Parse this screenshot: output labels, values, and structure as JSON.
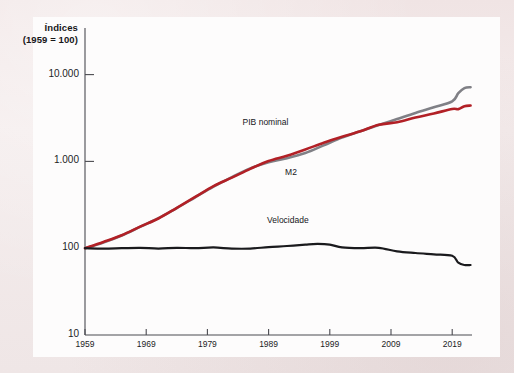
{
  "figure": {
    "background_color": "#f0e6e6",
    "panel_color": "#fdfcfc",
    "axis_color": "#4a4a50"
  },
  "chart_data": {
    "type": "line",
    "title": "",
    "subtitle": "",
    "axis_title_line1": "Índices",
    "axis_title_line2": "(1959 = 100)",
    "xlabel": "",
    "ylabel": "Índices (1959 = 100)",
    "yscale": "log",
    "ylim": [
      10,
      20000
    ],
    "xlim": [
      1959,
      2023
    ],
    "grid": false,
    "legend_position": "inline-annotations",
    "y_ticks": [
      10,
      100,
      1000,
      10000
    ],
    "y_tick_labels": [
      "10",
      "100",
      "1.000",
      "10.000"
    ],
    "x_ticks": [
      1959,
      1969,
      1979,
      1989,
      1999,
      2009,
      2019
    ],
    "x_tick_labels": [
      "1959",
      "1969",
      "1979",
      "1989",
      "1999",
      "2009",
      "2019"
    ],
    "series": [
      {
        "name": "PIB nominal",
        "label": "PIB nominal",
        "color": "#b22026",
        "x": [
          1959,
          1962,
          1965,
          1968,
          1971,
          1974,
          1977,
          1980,
          1983,
          1986,
          1989,
          1992,
          1995,
          1998,
          2001,
          2004,
          2007,
          2010,
          2013,
          2016,
          2019,
          2020,
          2021,
          2022
        ],
        "values": [
          100,
          118,
          141,
          177,
          220,
          292,
          389,
          520,
          650,
          820,
          1010,
          1160,
          1370,
          1640,
          1920,
          2220,
          2640,
          2820,
          3200,
          3560,
          4020,
          4000,
          4330,
          4400
        ]
      },
      {
        "name": "M2",
        "label": "M2",
        "color": "#808086",
        "x": [
          1959,
          1962,
          1965,
          1968,
          1971,
          1974,
          1977,
          1980,
          1983,
          1986,
          1989,
          1992,
          1995,
          1998,
          2001,
          2004,
          2007,
          2010,
          2013,
          2016,
          2019,
          2020,
          2021,
          2022
        ],
        "values": [
          100,
          116,
          140,
          176,
          222,
          290,
          386,
          512,
          660,
          830,
          980,
          1090,
          1250,
          1530,
          1880,
          2220,
          2620,
          3080,
          3620,
          4200,
          4900,
          6100,
          7000,
          7150
        ]
      },
      {
        "name": "Velocidade",
        "label": "Velocidade",
        "color": "#1a1a1d",
        "x": [
          1959,
          1962,
          1965,
          1968,
          1971,
          1974,
          1977,
          1980,
          1983,
          1986,
          1989,
          1992,
          1995,
          1997,
          1999,
          2001,
          2004,
          2007,
          2010,
          2013,
          2016,
          2019,
          2020,
          2021,
          2022
        ],
        "values": [
          100,
          99,
          100,
          101,
          99,
          101,
          100,
          102,
          99,
          99,
          103,
          106,
          110,
          112,
          110,
          102,
          100,
          101,
          92,
          88,
          85,
          82,
          68,
          64,
          64
        ]
      }
    ],
    "annotations": [
      {
        "text": "PIB nominal",
        "x": 1989,
        "y": 2100
      },
      {
        "text": "M2",
        "x": 1993,
        "y": 900
      },
      {
        "text": "Velocidade",
        "x": 1993,
        "y": 165
      }
    ]
  }
}
